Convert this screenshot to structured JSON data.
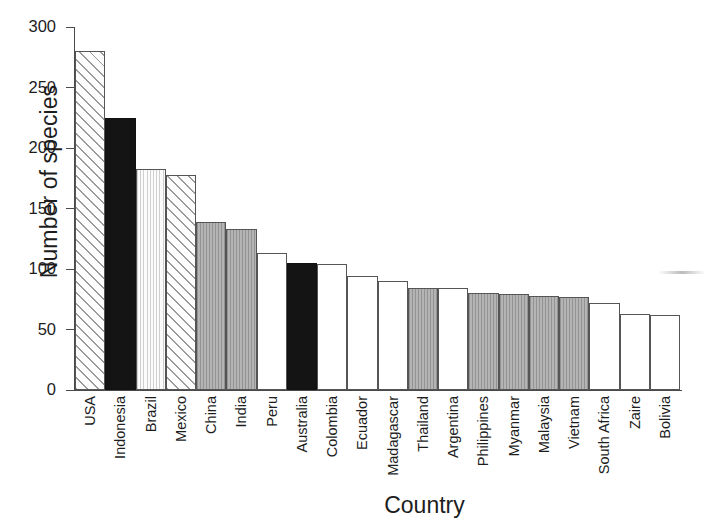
{
  "chart_data": {
    "type": "bar",
    "title": "",
    "xlabel": "Country",
    "ylabel": "Number of species",
    "ylim": [
      0,
      300
    ],
    "yticks": [
      0,
      50,
      100,
      150,
      200,
      250,
      300
    ],
    "grid": false,
    "legend": "none",
    "bar_gap": "none",
    "categories": [
      "USA",
      "Indonesia",
      "Brazil",
      "Mexico",
      "China",
      "India",
      "Peru",
      "Australia",
      "Colombia",
      "Ecuador",
      "Madagascar",
      "Thailand",
      "Argentina",
      "Philippines",
      "Myanmar",
      "Malaysia",
      "Vietnam",
      "South Africa",
      "Zaire",
      "Bolivia"
    ],
    "values": [
      280,
      225,
      183,
      178,
      139,
      133,
      113,
      105,
      104,
      94,
      90,
      84,
      84,
      80,
      79,
      78,
      77,
      72,
      63,
      62
    ],
    "bar_fills": [
      "hatch",
      "black",
      "dot",
      "hatch",
      "gray",
      "gray",
      "white",
      "black",
      "white",
      "white",
      "white",
      "gray",
      "white",
      "gray",
      "gray",
      "gray",
      "gray",
      "white",
      "white",
      "white"
    ],
    "bars": [
      {
        "label": "USA",
        "value": 280,
        "fill": "hatch"
      },
      {
        "label": "Indonesia",
        "value": 225,
        "fill": "black"
      },
      {
        "label": "Brazil",
        "value": 183,
        "fill": "dot"
      },
      {
        "label": "Mexico",
        "value": 178,
        "fill": "hatch"
      },
      {
        "label": "China",
        "value": 139,
        "fill": "gray"
      },
      {
        "label": "India",
        "value": 133,
        "fill": "gray"
      },
      {
        "label": "Peru",
        "value": 113,
        "fill": "white"
      },
      {
        "label": "Australia",
        "value": 105,
        "fill": "black"
      },
      {
        "label": "Colombia",
        "value": 104,
        "fill": "white"
      },
      {
        "label": "Ecuador",
        "value": 94,
        "fill": "white"
      },
      {
        "label": "Madagascar",
        "value": 90,
        "fill": "white"
      },
      {
        "label": "Thailand",
        "value": 84,
        "fill": "gray"
      },
      {
        "label": "Argentina",
        "value": 84,
        "fill": "white"
      },
      {
        "label": "Philippines",
        "value": 80,
        "fill": "gray"
      },
      {
        "label": "Myanmar",
        "value": 79,
        "fill": "gray"
      },
      {
        "label": "Malaysia",
        "value": 78,
        "fill": "gray"
      },
      {
        "label": "Vietnam",
        "value": 77,
        "fill": "gray"
      },
      {
        "label": "South Africa",
        "value": 72,
        "fill": "white"
      },
      {
        "label": "Zaire",
        "value": 63,
        "fill": "white"
      },
      {
        "label": "Bolivia",
        "value": 62,
        "fill": "white"
      }
    ],
    "colors": {
      "axis": "#4a4a4a",
      "text": "#1d1d1d",
      "bar_outline": "#555555",
      "fill_black": "#141414",
      "fill_gray": "#b4b4b4",
      "fill_white": "#ffffff",
      "fill_hatch_line": "#9a9a9a",
      "fill_dot_line": "#cfcfcf",
      "background": "#ffffff"
    }
  }
}
